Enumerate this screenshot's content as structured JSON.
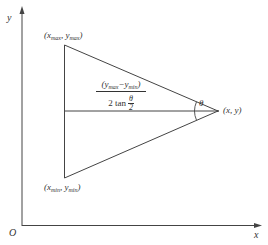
{
  "diagram": {
    "axes": {
      "y_label": "y",
      "x_label": "x",
      "origin_label": "O"
    },
    "vertices": {
      "top": {
        "base": "(x",
        "sub1": "max",
        "mid": ", y",
        "sub2": "max",
        "end": ")"
      },
      "bottom": {
        "base": "(x",
        "sub1": "min",
        "mid": ", y",
        "sub2": "min",
        "end": ")"
      },
      "apex": "(x, y)"
    },
    "distance_formula": {
      "numerator_prefix": "(y",
      "numerator_sub1": "max",
      "numerator_mid": "−y",
      "numerator_sub2": "min",
      "numerator_suffix": ")",
      "denominator_prefix": "2 tan",
      "denominator_frac_num": "θ",
      "denominator_frac_den": "2"
    },
    "angle_label": "θ",
    "colors": {
      "line": "#333333",
      "background": "#ffffff"
    }
  }
}
